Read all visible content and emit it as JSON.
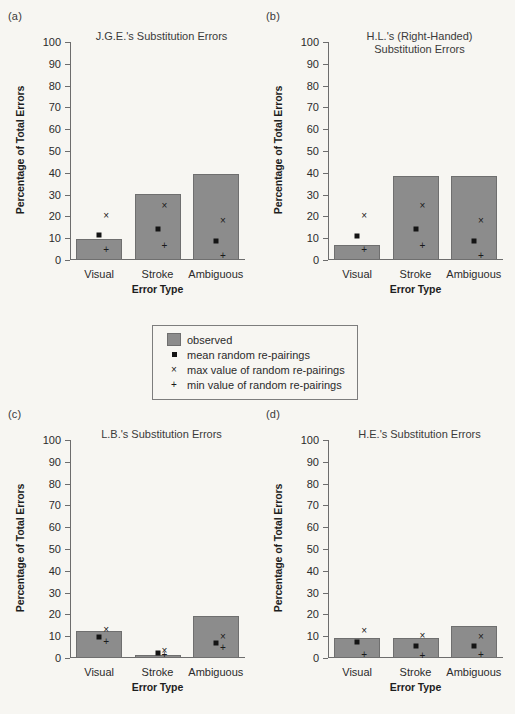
{
  "figure": {
    "axis": {
      "ylabel": "Percentage of Total Errors",
      "xlabel": "Error Type",
      "yticks": [
        "100",
        "90",
        "80",
        "70",
        "60",
        "50",
        "40",
        "30",
        "20",
        "10",
        "0"
      ],
      "categories": [
        "Visual",
        "Stroke",
        "Ambiguous"
      ]
    },
    "legend": {
      "items": [
        {
          "symbol": "swatch",
          "label": "observed"
        },
        {
          "symbol": "square",
          "label": "mean random re-pairings"
        },
        {
          "symbol": "×",
          "label": "max value of random re-pairings"
        },
        {
          "symbol": "+",
          "label": "min value of random re-pairings"
        }
      ]
    },
    "colors": {
      "bar_fill": "#8c8c8c",
      "bar_stroke": "#6f6f6f",
      "marker": "#141414",
      "background": "#f7f6f2"
    },
    "panels": [
      {
        "key": "a",
        "label": "(a)",
        "title": "J.G.E.'s Substitution Errors",
        "title_lines": [
          "J.G.E.'s Substitution Errors"
        ]
      },
      {
        "key": "b",
        "label": "(b)",
        "title": "H.L.'s (Right-Handed) Substitution Errors",
        "title_lines": [
          "H.L.'s (Right-Handed)",
          "Substitution Errors"
        ]
      },
      {
        "key": "c",
        "label": "(c)",
        "title": "L.B.'s Substitution Errors",
        "title_lines": [
          "L.B.'s Substitution Errors"
        ]
      },
      {
        "key": "d",
        "label": "(d)",
        "title": "H.E.'s Substitution Errors",
        "title_lines": [
          "H.E.'s Substitution Errors"
        ]
      }
    ]
  },
  "chart_data": [
    {
      "panel": "a",
      "type": "bar",
      "title": "J.G.E.'s Substitution Errors",
      "xlabel": "Error Type",
      "ylabel": "Percentage of Total Errors",
      "ylim": [
        0,
        100
      ],
      "grid": false,
      "legend_position": "center-below",
      "categories": [
        "Visual",
        "Stroke",
        "Ambiguous"
      ],
      "series": [
        {
          "name": "observed",
          "values": [
            9.5,
            30.3,
            39.3
          ]
        },
        {
          "name": "mean random re-pairings",
          "values": [
            11.3,
            14.3,
            8.7
          ]
        },
        {
          "name": "max value of random re-pairings",
          "values": [
            20.0,
            24.8,
            18.0
          ]
        },
        {
          "name": "min value of random re-pairings",
          "values": [
            4.5,
            6.2,
            1.8
          ]
        }
      ]
    },
    {
      "panel": "b",
      "type": "bar",
      "title": "H.L.'s (Right-Handed) Substitution Errors",
      "xlabel": "Error Type",
      "ylabel": "Percentage of Total Errors",
      "ylim": [
        0,
        100
      ],
      "grid": false,
      "legend_position": "center-below",
      "categories": [
        "Visual",
        "Stroke",
        "Ambiguous"
      ],
      "series": [
        {
          "name": "observed",
          "values": [
            7.0,
            38.4,
            38.4
          ]
        },
        {
          "name": "mean random re-pairings",
          "values": [
            11.2,
            14.2,
            8.6
          ]
        },
        {
          "name": "max value of random re-pairings",
          "values": [
            20.0,
            24.8,
            18.0
          ]
        },
        {
          "name": "min value of random re-pairings",
          "values": [
            4.6,
            6.3,
            1.8
          ]
        }
      ]
    },
    {
      "panel": "c",
      "type": "bar",
      "title": "L.B.'s Substitution Errors",
      "xlabel": "Error Type",
      "ylabel": "Percentage of Total Errors",
      "ylim": [
        0,
        100
      ],
      "grid": false,
      "legend_position": "center-above",
      "categories": [
        "Visual",
        "Stroke",
        "Ambiguous"
      ],
      "series": [
        {
          "name": "observed",
          "values": [
            12.3,
            1.5,
            19.2
          ]
        },
        {
          "name": "mean random re-pairings",
          "values": [
            9.8,
            2.2,
            6.7
          ]
        },
        {
          "name": "max value of random re-pairings",
          "values": [
            13.0,
            3.4,
            9.5
          ]
        },
        {
          "name": "min value of random re-pairings",
          "values": [
            7.5,
            1.2,
            4.4
          ]
        }
      ]
    },
    {
      "panel": "d",
      "type": "bar",
      "title": "H.E.'s Substitution Errors",
      "xlabel": "Error Type",
      "ylabel": "Percentage of Total Errors",
      "ylim": [
        0,
        100
      ],
      "grid": false,
      "legend_position": "center-above",
      "categories": [
        "Visual",
        "Stroke",
        "Ambiguous"
      ],
      "series": [
        {
          "name": "observed",
          "values": [
            9.4,
            9.2,
            14.7
          ]
        },
        {
          "name": "mean random re-pairings",
          "values": [
            7.2,
            5.6,
            5.5
          ]
        },
        {
          "name": "max value of random re-pairings",
          "values": [
            12.5,
            10.0,
            9.8
          ]
        },
        {
          "name": "min value of random re-pairings",
          "values": [
            1.3,
            0.8,
            1.2
          ]
        }
      ]
    }
  ]
}
